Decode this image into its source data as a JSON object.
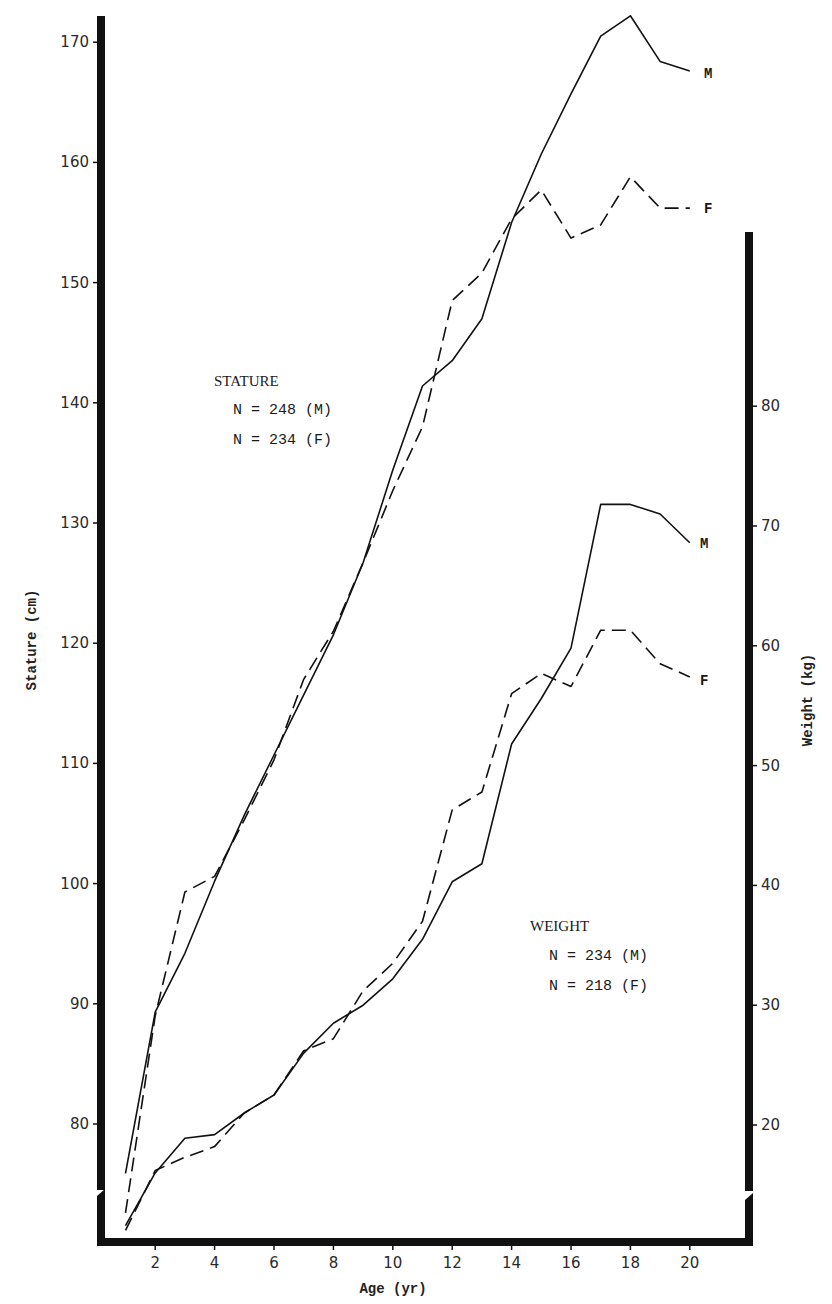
{
  "chart_data": {
    "type": "line",
    "title": "",
    "xlabel": "Age (yr)",
    "ylabel_left": "Stature (cm)",
    "ylabel_right": "Weight (kg)",
    "x_ticks": [
      2,
      4,
      6,
      8,
      10,
      12,
      14,
      16,
      18,
      20
    ],
    "y_left_ticks": [
      80,
      90,
      100,
      110,
      120,
      130,
      140,
      150,
      160,
      170
    ],
    "y_right_ticks": [
      20,
      30,
      40,
      50,
      60,
      70,
      80
    ],
    "xlim": [
      0,
      22
    ],
    "ylim_left": [
      70,
      172
    ],
    "ylim_right": [
      10,
      92
    ],
    "grid": false,
    "axis_breaks": true,
    "x": [
      1,
      2,
      3,
      4,
      5,
      6,
      7,
      8,
      9,
      10,
      11,
      12,
      13,
      14,
      15,
      16,
      17,
      18,
      19,
      20
    ],
    "series": [
      {
        "name": "Stature M",
        "group": "stature",
        "sex": "M",
        "axis": "left",
        "style": "solid",
        "end_label": "M",
        "values": [
          75.9,
          89.3,
          94.2,
          100.2,
          105.7,
          110.7,
          115.7,
          120.7,
          126.7,
          134.4,
          141.4,
          143.5,
          147.0,
          155.0,
          160.7,
          165.7,
          170.5,
          172.2,
          168.4,
          167.6
        ]
      },
      {
        "name": "Stature F",
        "group": "stature",
        "sex": "F",
        "axis": "left",
        "style": "dashed",
        "end_label": "F",
        "values": [
          72.6,
          89.0,
          99.3,
          100.6,
          105.3,
          110.3,
          117.0,
          121.0,
          126.7,
          132.7,
          138.0,
          148.5,
          150.8,
          155.3,
          157.7,
          153.7,
          154.8,
          158.8,
          156.2,
          156.2
        ]
      },
      {
        "name": "Weight M",
        "group": "weight",
        "sex": "M",
        "axis": "right",
        "style": "solid",
        "end_label": "M",
        "values": [
          11.6,
          16.0,
          18.9,
          19.2,
          21.0,
          22.5,
          26.0,
          28.5,
          30.0,
          32.2,
          35.5,
          40.3,
          41.8,
          51.8,
          55.6,
          59.8,
          71.8,
          71.8,
          71.0,
          68.6
        ]
      },
      {
        "name": "Weight F",
        "group": "weight",
        "sex": "F",
        "axis": "right",
        "style": "dashed",
        "end_label": "F",
        "values": [
          11.2,
          16.2,
          17.3,
          18.2,
          21.0,
          22.5,
          26.2,
          27.2,
          31.2,
          33.5,
          37.0,
          46.3,
          47.8,
          56.0,
          57.7,
          56.6,
          61.3,
          61.3,
          58.5,
          57.4
        ]
      }
    ],
    "annotations": [
      {
        "id": "stature",
        "title": "STATURE",
        "lines": [
          "N = 248 (M)",
          "N = 234 (F)"
        ]
      },
      {
        "id": "weight",
        "title": "WEIGHT",
        "lines": [
          "N = 234 (M)",
          "N = 218 (F)"
        ]
      }
    ]
  },
  "labels": {
    "xlabel": "Age (yr)",
    "ylabel_left": "Stature (cm)",
    "ylabel_right": "Weight (kg)",
    "stature_title": "STATURE",
    "stature_n_m": "N = 248 (M)",
    "stature_n_f": "N = 234 (F)",
    "weight_title": "WEIGHT",
    "weight_n_m": "N = 234 (M)",
    "weight_n_f": "N = 218 (F)",
    "stature_m": "M",
    "stature_f": "F",
    "weight_m": "M",
    "weight_f": "F"
  },
  "colors": {
    "ink": "#111111",
    "background": "#ffffff"
  }
}
